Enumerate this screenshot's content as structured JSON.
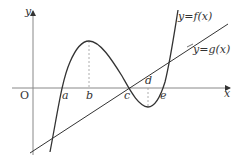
{
  "diagram": {
    "title": "",
    "axes": {
      "x_label": "x",
      "y_label": "y",
      "origin_label": "O"
    },
    "curves": [
      {
        "name": "cubic",
        "label": "y=f(x)"
      },
      {
        "name": "line",
        "label": "y=g(x)"
      }
    ],
    "points": {
      "a": "a",
      "b": "b",
      "c": "c",
      "d": "d",
      "e": "e"
    },
    "colors": {
      "curve": "#333333",
      "axis": "#888888",
      "dashed": "#999999"
    }
  }
}
